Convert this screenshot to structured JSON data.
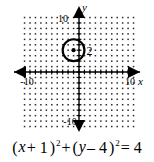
{
  "graph": {
    "axes": {
      "x_axis_label": "x",
      "y_axis_label": "y",
      "x_min_tick_label": "-10",
      "x_max_tick_label": "10",
      "y_min_tick_label": "-10",
      "y_max_tick_label": "10"
    },
    "grid": {
      "style": "dotted",
      "x_range": [
        -10,
        10
      ],
      "y_range": [
        -10,
        10
      ],
      "spacing": 1
    },
    "circle": {
      "center_x": -1,
      "center_y": 4,
      "radius": 2,
      "radius_label": "2",
      "stroke_color": "#000000"
    }
  },
  "equation": {
    "full_text": "(x + 1)^2 + (y - 4)^2 = 4",
    "open_paren_1": "(",
    "var_x": "x",
    "plus_1": "+ 1",
    "close_paren_1": ")",
    "exponent_1": "2",
    "plus_middle": "+",
    "open_paren_2": "(",
    "var_y": "y",
    "minus_4": "– 4",
    "close_paren_2": ")",
    "exponent_2": "2",
    "equals": "= 4"
  },
  "chart_data": {
    "type": "scatter",
    "title": "",
    "xlabel": "x",
    "ylabel": "y",
    "xlim": [
      -10,
      10
    ],
    "ylim": [
      -10,
      10
    ],
    "grid": true,
    "legend": "none",
    "annotations": [
      {
        "kind": "circle",
        "center": [
          -1,
          4
        ],
        "radius": 2,
        "label": "2",
        "equation": "(x + 1)^2 + (y - 4)^2 = 4"
      },
      {
        "kind": "point",
        "coords": [
          -1,
          4
        ],
        "label": "center"
      }
    ],
    "tick_labels": {
      "x": [
        "-10",
        "10"
      ],
      "y": [
        "-10",
        "10"
      ]
    }
  }
}
